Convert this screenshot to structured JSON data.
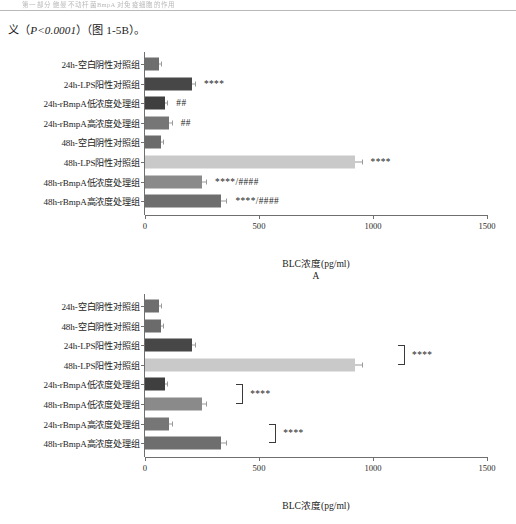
{
  "page": {
    "running_header": "第一部分  鲍曼不动杆菌BmpA 对免疫细胞的作用",
    "paragraph_prefix": "义（",
    "paragraph_pvalue": "P<0.0001",
    "paragraph_suffix": "）（图 1-5B）。"
  },
  "axis": {
    "title": "BLC浓度(pg/ml)",
    "ticks": [
      0,
      500,
      1000,
      1500
    ],
    "tick_labels": [
      "0",
      "500",
      "1000",
      "1500"
    ],
    "min": 0,
    "max": 1500
  },
  "colors": {
    "bar_dark": "#4a4a4a",
    "bar_mid": "#7b7b7b",
    "bar_light": "#c9c9c9",
    "axis": "#6f6f6f",
    "text": "#1a1a1a"
  },
  "chart_data": [
    {
      "type": "bar",
      "orientation": "horizontal",
      "panel": "A",
      "title": "",
      "xlabel": "BLC浓度(pg/ml)",
      "ylabel": "",
      "xlim": [
        0,
        1500
      ],
      "grid": false,
      "legend": "none",
      "categories": [
        "24h-空白阴性对照组",
        "24h-LPS阳性对照组",
        "24h-rBmpA低浓度处理组",
        "24h-rBmpA高浓度处理组",
        "48h-空白阴性对照组",
        "48h-LPS阳性对照组",
        "48h-rBmpA低浓度处理组",
        "48h-rBmpA高浓度处理组"
      ],
      "values": [
        62,
        205,
        88,
        106,
        70,
        920,
        250,
        335
      ],
      "errors": [
        8,
        14,
        10,
        11,
        8,
        30,
        18,
        22
      ],
      "colors": [
        "#6e6e6e",
        "#474747",
        "#3f3f3f",
        "#767676",
        "#6b6b6b",
        "#c9c9c9",
        "#8a8a8a",
        "#6e6e6e"
      ],
      "annotations": [
        "",
        "****",
        "##",
        "##",
        "",
        "****",
        "****/####",
        "****/####"
      ]
    },
    {
      "type": "bar",
      "orientation": "horizontal",
      "panel": "B",
      "title": "",
      "xlabel": "BLC浓度(pg/ml)",
      "ylabel": "",
      "xlim": [
        0,
        1500
      ],
      "grid": false,
      "legend": "none",
      "categories": [
        "24h-空白阴性对照组",
        "48h-空白阴性对照组",
        "24h-LPS阳性对照组",
        "48h-LPS阳性对照组",
        "24h-rBmpA低浓度处理组",
        "48h-rBmpA低浓度处理组",
        "24h-rBmpA高浓度处理组",
        "48h-rBmpA高浓度处理组"
      ],
      "values": [
        62,
        70,
        205,
        920,
        88,
        250,
        106,
        335
      ],
      "errors": [
        8,
        9,
        14,
        30,
        10,
        18,
        11,
        22
      ],
      "colors": [
        "#6e6e6e",
        "#6b6b6b",
        "#474747",
        "#c9c9c9",
        "#3f3f3f",
        "#8a8a8a",
        "#767676",
        "#6e6e6e"
      ],
      "annotations": [
        "",
        "",
        "",
        "",
        "",
        "",
        "",
        ""
      ],
      "brackets": [
        {
          "from_index": 2,
          "to_index": 3,
          "label": "****",
          "x": 1110
        },
        {
          "from_index": 4,
          "to_index": 5,
          "label": "****",
          "x": 400
        },
        {
          "from_index": 6,
          "to_index": 7,
          "label": "****",
          "x": 545
        }
      ]
    }
  ]
}
